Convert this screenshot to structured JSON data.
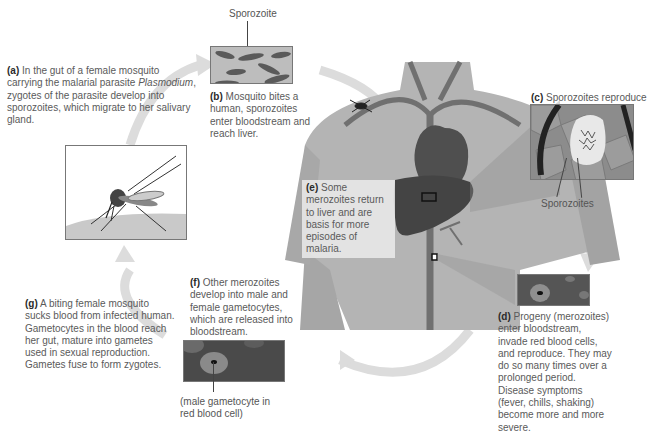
{
  "diagram": {
    "steps": [
      {
        "id": "a",
        "tag": "(a)",
        "text_before": " In the gut of a female mosquito carrying the malarial parasite ",
        "italic": "Plasmodium",
        "text_after": ", zygotes of the parasite develop into sporozoites, which migrate to her salivary gland."
      },
      {
        "id": "b",
        "tag": "(b)",
        "text": " Mosquito bites a human, sporozoites enter bloodstream and reach liver."
      },
      {
        "id": "c",
        "tag": "(c)",
        "text": " Sporozoites reproduce in liver cells."
      },
      {
        "id": "d",
        "tag": "(d)",
        "text": " Progeny (merozoites) enter bloodstream, invade red blood cells, and reproduce. They may do so many times over a prolonged period. Disease symptoms (fever, chills, shaking) become more and more severe."
      },
      {
        "id": "e",
        "tag": "(e)",
        "text": " Some merozoites return to liver and are basis for more episodes of malaria."
      },
      {
        "id": "f",
        "tag": "(f)",
        "text": " Other merozoites develop into male and female gametocytes, which are released into bloodstream."
      },
      {
        "id": "g",
        "tag": "(g)",
        "text": " A biting female mosquito sucks blood from infected human. Gametocytes in the blood reach her gut, mature into gametes used in sexual reproduction. Gametes fuse to form zygotes."
      }
    ],
    "labels": {
      "sporozoite": "Sporozoite",
      "sporozoites": "Sporozoites",
      "male_gametocyte": "(male gametocyte in red blood cell)"
    },
    "colors": {
      "arrow": "#d9d9d9",
      "body": "#a9a9a9",
      "organ": "#4a4a4a",
      "vessel": "#6a6a6a",
      "text": "#5a5a5a"
    }
  }
}
